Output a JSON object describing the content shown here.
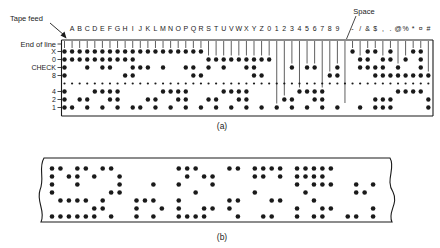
{
  "figure": {
    "labels": {
      "tape_feed": "Tape feed",
      "end_of_line": "End of line",
      "space": "Space"
    },
    "channels": [
      "X",
      "0",
      "CHECK",
      "8",
      "4",
      "2",
      "1"
    ],
    "caption_a": "(a)",
    "caption_b": "(b)",
    "colors": {
      "ink": "#1a1a1a",
      "paper": "#ffffff"
    }
  },
  "tape_a": {
    "description": "8-channel punched paper tape code chart",
    "characters": "ABCDEFGHIJKLMNOPQRSTUVWXYZ0123456789 -/&$,.@%*¤#",
    "tape_feed_code": "XOC8421",
    "codes": {
      "A": "XO1",
      "B": "XO2",
      "C": "XOC21",
      "D": "XO4",
      "E": "XOC41",
      "F": "XOC42",
      "G": "XO421",
      "H": "XO8",
      "I": "XOC81",
      "J": "XC1",
      "K": "XC2",
      "L": "X21",
      "M": "XC4",
      "N": "X41",
      "O": "X42",
      "P": "XC421",
      "Q": "XC8",
      "R": "X81",
      "S": "OC2",
      "T": "O21",
      "U": "OC4",
      "V": "O41",
      "W": "O42",
      "X": "OC421",
      "Y": "OC8",
      "Z": "O81",
      "0": "O",
      "1": "1",
      "2": "2",
      "3": "C21",
      "4": "4",
      "5": "C41",
      "6": "C42",
      "7": "421",
      "8": "8",
      "9": "C81",
      " ": "",
      "-": "X",
      "/": "OC1",
      "&": "XOC",
      "$": "XC821",
      ",": "OC821",
      ".": "XO821",
      "@": "C84",
      "%": "O84",
      "*": "X84",
      "¤": "XOC84",
      "#": "821"
    }
  },
  "tape_b": {
    "description": "sample punched message tape",
    "message": "INVENTORY 7452 PARTS ON HAND CHECK 1983"
  }
}
